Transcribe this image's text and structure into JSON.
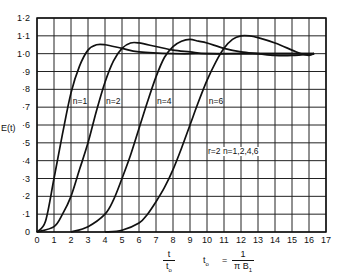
{
  "chart_data": {
    "type": "line",
    "title": "",
    "xlabel": {
      "numerator": "t",
      "denominator": "t",
      "denominator_sub": "o"
    },
    "ylabel": "E(t)",
    "xlim": [
      0,
      17
    ],
    "ylim": [
      0,
      1.2
    ],
    "grid": true,
    "legend_position": "inline labels on curves",
    "x_ticks": [
      "0",
      "1",
      "2",
      "3",
      "4",
      "5",
      "6",
      "7",
      "8",
      "9",
      "10",
      "11",
      "12",
      "13",
      "14",
      "15",
      "16",
      "17"
    ],
    "y_ticks": [
      "0",
      "·1",
      "·2",
      "·3",
      "·4",
      "·5",
      "·6",
      "·7",
      "·8",
      "·9",
      "1·0",
      "1·1",
      "1·2"
    ],
    "annotations": [
      {
        "text": "n=1",
        "x": 2.05,
        "y": 0.73
      },
      {
        "text": "n=2",
        "x": 4.0,
        "y": 0.73
      },
      {
        "text": "n=4",
        "x": 7.0,
        "y": 0.73
      },
      {
        "text": "n=6",
        "x": 10.05,
        "y": 0.73
      },
      {
        "text": "r=2 n=1,2,4,6",
        "x": 10.0,
        "y": 0.45
      },
      {
        "text_parts": [
          "t",
          "o",
          " = ",
          "1",
          "π B",
          "1"
        ],
        "description": "t0 = 1/(π B1)"
      }
    ],
    "series": [
      {
        "name": "n=1",
        "x": [
          0,
          0.5,
          1,
          1.5,
          2,
          2.5,
          3,
          3.5,
          4,
          5,
          6,
          8,
          10,
          12,
          14,
          16.3
        ],
        "y": [
          0,
          0.06,
          0.3,
          0.55,
          0.78,
          0.93,
          1.02,
          1.05,
          1.05,
          1.03,
          1.01,
          1.0,
          1.0,
          1.0,
          1.0,
          1.0
        ]
      },
      {
        "name": "n=2",
        "x": [
          0,
          1,
          1.5,
          2,
          2.5,
          3,
          3.5,
          4,
          4.5,
          5,
          5.5,
          6,
          7,
          8,
          9,
          10,
          12,
          14,
          16.3
        ],
        "y": [
          0,
          0.03,
          0.1,
          0.2,
          0.35,
          0.5,
          0.68,
          0.84,
          0.96,
          1.03,
          1.06,
          1.06,
          1.04,
          1.02,
          1.01,
          1.0,
          1.0,
          1.0,
          1.0
        ]
      },
      {
        "name": "n=4",
        "x": [
          2,
          3,
          4,
          4.5,
          5,
          5.5,
          6,
          6.5,
          7,
          7.5,
          8,
          8.5,
          9,
          9.5,
          10,
          11,
          12,
          13,
          14,
          15,
          16.3
        ],
        "y": [
          0,
          0.03,
          0.1,
          0.18,
          0.3,
          0.43,
          0.58,
          0.73,
          0.87,
          0.98,
          1.04,
          1.07,
          1.08,
          1.07,
          1.06,
          1.03,
          1.01,
          1.0,
          0.99,
          0.99,
          1.0
        ]
      },
      {
        "name": "n=6",
        "x": [
          4,
          5,
          6,
          6.5,
          7,
          7.5,
          8,
          8.5,
          9,
          9.5,
          10,
          10.5,
          11,
          11.5,
          12,
          12.5,
          13,
          14,
          15,
          15.5,
          16,
          16.3
        ],
        "y": [
          0,
          0.01,
          0.05,
          0.1,
          0.17,
          0.25,
          0.35,
          0.47,
          0.6,
          0.73,
          0.85,
          0.95,
          1.03,
          1.08,
          1.1,
          1.1,
          1.09,
          1.06,
          1.02,
          1.0,
          0.99,
          1.0
        ]
      }
    ]
  },
  "labels": {
    "ylabel": "E(t)",
    "xlabel_num": "t",
    "xlabel_den": "t",
    "xlabel_den_sub": "o",
    "formula_lhs": "t",
    "formula_lhs_sub": "o",
    "formula_eq": "=",
    "formula_num": "1",
    "formula_den": "π B",
    "formula_den_sub": "1",
    "param_note": "r=2 n=1,2,4,6"
  },
  "colors": {
    "line": "#111111",
    "grid": "#222222",
    "background": "#ffffff"
  }
}
